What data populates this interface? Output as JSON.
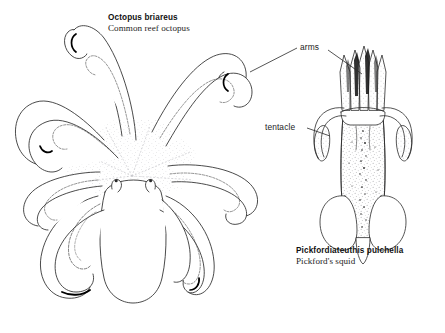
{
  "figure": {
    "type": "scientific-line-illustration",
    "background_color": "#ffffff",
    "ink_color": "#1a1a1a"
  },
  "octopus": {
    "scientific_name": "Octopus briareus",
    "common_name": "Common reef octopus",
    "features": [
      "arms",
      "suckers",
      "mantle",
      "eyes",
      "web"
    ],
    "arm_count": 8
  },
  "squid": {
    "scientific_name": "Pickfordiateuthis pulchella",
    "common_name": "Pickford's squid",
    "features": [
      "arms",
      "tentacle",
      "mantle",
      "fins",
      "chromatophores"
    ],
    "arm_count": 8,
    "tentacle_count": 2
  },
  "callouts": [
    {
      "label": "arms",
      "points_to": [
        "octopus-arm",
        "squid-arms"
      ]
    },
    {
      "label": "tentacle",
      "points_to": [
        "squid-tentacle"
      ]
    }
  ]
}
